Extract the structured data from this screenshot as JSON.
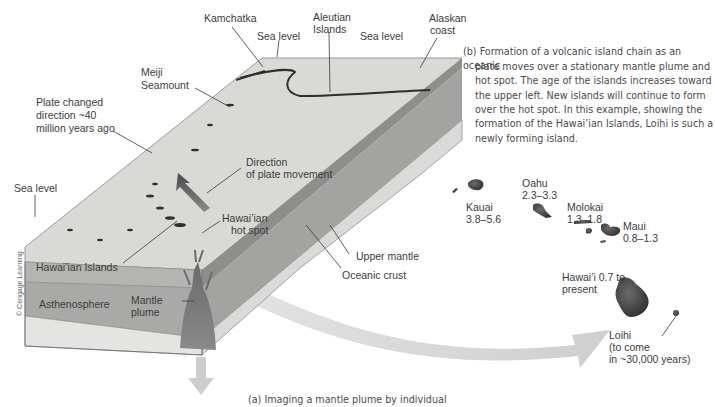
{
  "figure": {
    "caption_b": "(b) Formation of a volcanic island chain as an oceanic plate moves over a stationary mantle plume and hot spot. The age of the islands increases toward the upper left. New islands will continue to form over the hot spot. In this example, showing the formation of the Hawai’ian Islands, Loihi is such a newly forming island.",
    "caption_b_lines": [
      "(b) Formation of a volcanic island chain as an oceanic",
      "plate moves over a stationary mantle plume and",
      "hot spot. The age of the islands increases toward",
      "the upper left. New islands will continue to form",
      "over the hot spot. In this example, showing the",
      "formation of the Hawai’ian Islands, Loihi is such a",
      "newly forming island."
    ],
    "caption_a_partial": "(a) Imaging a mantle plume by individual",
    "credit": "© Cengage Learning"
  },
  "block_labels": {
    "kamchatka": "Kamchatka",
    "aleutian_1": "Aleutian",
    "aleutian_2": "Islands",
    "alaskan_1": "Alaskan",
    "alaskan_2": "coast",
    "sea_level_top_left": "Sea level",
    "sea_level_top_right": "Sea level",
    "sea_level_left": "Sea level",
    "meiji_1": "Meiji",
    "meiji_2": "Seamount",
    "plate_changed_1": "Plate changed",
    "plate_changed_2": "direction ~40",
    "plate_changed_3": "million years ago",
    "direction_1": "Direction",
    "direction_2": "of plate movement",
    "hotspot_1": "Hawai’ian",
    "hotspot_2": "hot spot",
    "hawaiian_islands": "Hawai’ian Islands",
    "asthenosphere": "Asthenosphere",
    "mantle_plume_1": "Mantle",
    "mantle_plume_2": "plume",
    "upper_mantle": "Upper mantle",
    "oceanic_crust": "Oceanic crust"
  },
  "islands": [
    {
      "name": "Kauai",
      "age": "3.8–5.6"
    },
    {
      "name": "Oahu",
      "age": "2.3–3.3"
    },
    {
      "name": "Molokai",
      "age": "1.3–1.8"
    },
    {
      "name": "Maui",
      "age": "0.8–1.3"
    },
    {
      "name": "Hawai’i 0.7 to",
      "age": "present"
    },
    {
      "name": "Loihi",
      "age": "(to come",
      "note": "in ~30,000 years)"
    }
  ],
  "colors": {
    "surface": "#d9d9d6",
    "front_crust": "#b4b4b2",
    "front_upper_mantle": "#a9a9a7",
    "front_asthenosphere": "#e4e4e2",
    "side_dark": "#8e8e8c",
    "side_mid": "#a3a3a1",
    "side_light": "#dadad8",
    "arrow": "#cfcfcf",
    "island": "#3e3e3e"
  }
}
